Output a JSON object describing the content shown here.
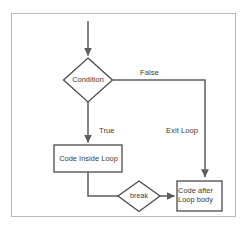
{
  "diagram": {
    "type": "flowchart",
    "canvas": {
      "width": 248,
      "height": 227
    },
    "frame": {
      "border_color": "#b9b9b9",
      "background": "#ffffff"
    },
    "style": {
      "line_color": "#5d5d5d",
      "node_border_color": "#4a4a4a",
      "text_color": "#3a3a3a",
      "node_fill": "#ffffff",
      "stroke_width": 1.5
    },
    "nodes": [
      {
        "id": "condition",
        "shape": "diamond",
        "label": "Condition",
        "center": [
          88,
          80
        ],
        "width": 49,
        "height": 44
      },
      {
        "id": "code-inside-loop",
        "shape": "rectangle",
        "label": "Code Inside Loop",
        "x": 54,
        "y": 145,
        "width": 68,
        "height": 27
      },
      {
        "id": "break",
        "shape": "diamond",
        "label": "break",
        "center": [
          139,
          196
        ],
        "width": 42,
        "height": 31
      },
      {
        "id": "code-after-loop-body",
        "shape": "rectangle",
        "label": "Code after\nLoop body",
        "x": 177,
        "y": 181,
        "width": 45,
        "height": 30
      }
    ],
    "edges": [
      {
        "id": "entry",
        "from": "start",
        "to": "condition",
        "label": "",
        "arrow": true
      },
      {
        "id": "condition-true",
        "from": "condition",
        "to": "code-inside-loop",
        "label": "True",
        "arrow": true
      },
      {
        "id": "condition-false",
        "from": "condition",
        "to": "code-after-loop-body",
        "label": "False",
        "arrow": true
      },
      {
        "id": "exit-loop",
        "from": "condition",
        "to": "code-after-loop-body",
        "label": "Exit Loop",
        "arrow": true
      },
      {
        "id": "loop-to-break",
        "from": "code-inside-loop",
        "to": "break",
        "label": "",
        "arrow": false
      },
      {
        "id": "break-to-after",
        "from": "break",
        "to": "code-after-loop-body",
        "label": "",
        "arrow": true
      }
    ],
    "edge_labels": {
      "false": "False",
      "true": "True",
      "exit_loop": "Exit Loop"
    }
  }
}
